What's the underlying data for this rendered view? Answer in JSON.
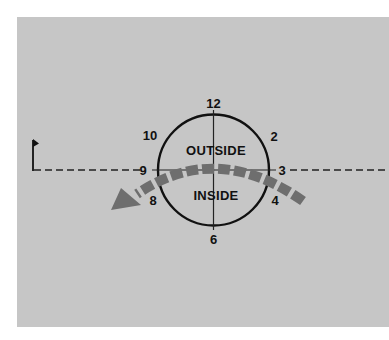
{
  "diagram": {
    "type": "clock-face-putting-guide",
    "colors": {
      "background": "#c6c6c6",
      "line": "#111111",
      "arrow": "#6e6e6e"
    },
    "clock_labels": {
      "twelve": "12",
      "two": "2",
      "three": "3",
      "four": "4",
      "six": "6",
      "eight": "8",
      "nine": "9",
      "ten": "10"
    },
    "regions": {
      "upper": "OUTSIDE",
      "lower": "INSIDE"
    },
    "elements": {
      "flag": "flag-icon at left end of target line",
      "target_line": "dashed horizontal line through 9 and 3",
      "arc_arrow": "dashed curved arrow from 4 o'clock side sweeping over to lower-left past 8"
    }
  }
}
